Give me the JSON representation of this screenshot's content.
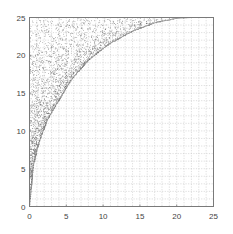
{
  "chart_data": {
    "type": "scatter",
    "title": "",
    "xlabel": "",
    "ylabel": "",
    "xlim": [
      0,
      25
    ],
    "ylim": [
      0,
      25
    ],
    "xticks": [
      0,
      5,
      10,
      15,
      20,
      25
    ],
    "yticks": [
      0,
      5,
      10,
      15,
      20,
      25
    ],
    "xtick_labels": [
      "0",
      "5",
      "10",
      "15",
      "20",
      "25"
    ],
    "ytick_labels": [
      "0",
      "5",
      "10",
      "15",
      "20",
      "25"
    ],
    "grid": true,
    "grid_step": 1,
    "legend": null,
    "series": [
      {
        "name": "region-points",
        "description": "Dense random points filling the region left of/above the boundary curve; densest near the curve",
        "marker": "dot",
        "color": "#555555",
        "point_count": 2600
      },
      {
        "name": "boundary-curve",
        "description": "Elliptical arc from (0,0) rising to (22,25), approx y = 25*sqrt(1-((22-x)/22)^2)",
        "x": [
          0,
          0.5,
          1,
          1.6,
          2.5,
          4,
          5.7,
          8,
          10.8,
          14,
          17,
          20,
          22
        ],
        "y": [
          0,
          5.3,
          7.5,
          9.4,
          11.6,
          14.1,
          16.8,
          19.4,
          21.5,
          23.2,
          24.3,
          24.9,
          25
        ]
      }
    ]
  },
  "colors": {
    "axis": "#7a7a7a",
    "grid": "#c8c8c8",
    "points": "#555555",
    "background": "#ffffff"
  }
}
